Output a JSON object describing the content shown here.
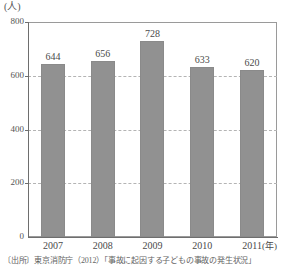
{
  "chart_data": {
    "type": "bar",
    "title": "",
    "subtitle": "",
    "xlabel": "(年)",
    "ylabel": "(人)",
    "categories": [
      "2007",
      "2008",
      "2009",
      "2010",
      "2011"
    ],
    "values": [
      644,
      656,
      728,
      633,
      620
    ],
    "series": [
      {
        "name": "人数",
        "values": [
          644,
          656,
          728,
          633,
          620
        ]
      }
    ],
    "ylim": [
      0,
      800
    ],
    "yticks": [
      0,
      200,
      400,
      600,
      800
    ],
    "ytick_labels": [
      "0",
      "200",
      "400",
      "600",
      "800"
    ],
    "grid": true,
    "grid_axis": "y",
    "grid_style": "dashed",
    "legend": false,
    "legend_position": "none",
    "data_labels": [
      "644",
      "656",
      "728",
      "633",
      "620"
    ],
    "bar_color": "#919191",
    "bar_border_color": "#8a8a8a",
    "axis_color": "#6e6e6e",
    "grid_color": "#b4b4b4",
    "text_color": "#4a4a4a"
  },
  "axes": {
    "y_unit_label": "(人)",
    "x_unit_label": "(年)"
  },
  "footer": {
    "source_note": "〔出所〕東京消防庁（2012）「事故に起因する子どもの事故の発生状況」"
  }
}
